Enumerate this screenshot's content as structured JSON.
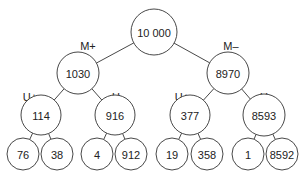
{
  "diagram": {
    "type": "binary-tree",
    "root": {
      "id": "root",
      "value": "10 000",
      "children": [
        {
          "id": "m-plus",
          "branch_label": "M+",
          "value": "1030",
          "children": [
            {
              "id": "m-plus-u-plus",
              "branch_label": "U+",
              "value": "114",
              "children": [
                {
                  "id": "m-plus-u-plus-left",
                  "value": "76"
                },
                {
                  "id": "m-plus-u-plus-right",
                  "value": "38"
                }
              ]
            },
            {
              "id": "m-plus-u-minus",
              "branch_label": "U–",
              "value": "916",
              "children": [
                {
                  "id": "m-plus-u-minus-left",
                  "value": "4"
                },
                {
                  "id": "m-plus-u-minus-right",
                  "value": "912"
                }
              ]
            }
          ]
        },
        {
          "id": "m-minus",
          "branch_label": "M–",
          "value": "8970",
          "children": [
            {
              "id": "m-minus-u-plus",
              "branch_label": "U+",
              "value": "377",
              "children": [
                {
                  "id": "m-minus-u-plus-left",
                  "value": "19"
                },
                {
                  "id": "m-minus-u-plus-right",
                  "value": "358"
                }
              ]
            },
            {
              "id": "m-minus-u-minus",
              "branch_label": "U–",
              "value": "8593",
              "children": [
                {
                  "id": "m-minus-u-minus-left",
                  "value": "1"
                },
                {
                  "id": "m-minus-u-minus-right",
                  "value": "8592"
                }
              ]
            }
          ]
        }
      ]
    }
  }
}
